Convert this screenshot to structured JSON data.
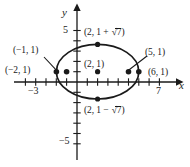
{
  "figure": {
    "background_color": "#ffffff",
    "ink_color": "#1a1a1a"
  },
  "axes": {
    "x_axis_name": "x",
    "y_axis_name": "y",
    "x_tick_labels": [
      {
        "text": "−3",
        "value": -3
      },
      {
        "text": "7",
        "value": 7
      }
    ],
    "y_tick_labels": [
      {
        "text": "5",
        "value": 5
      },
      {
        "text": "−5",
        "value": -5
      }
    ]
  },
  "points": [
    {
      "name": "vertex-top",
      "label_prefix": "(2, 1 + ",
      "label_radical": "7",
      "label_suffix": ")",
      "x": 2,
      "y": 3.6458
    },
    {
      "name": "vertex-bottom",
      "label_prefix": "(2, 1 − ",
      "label_radical": "7",
      "label_suffix": ")",
      "x": 2,
      "y": -1.6458
    },
    {
      "name": "vertex-left",
      "label": "(−2, 1)",
      "x": -2,
      "y": 1
    },
    {
      "name": "focus-left",
      "label": "(−1, 1)",
      "x": -1,
      "y": 1
    },
    {
      "name": "center",
      "label": "(2, 1)",
      "x": 2,
      "y": 1
    },
    {
      "name": "focus-right",
      "label": "(5, 1)",
      "x": 5,
      "y": 1
    },
    {
      "name": "vertex-right",
      "label": "(6, 1)",
      "x": 6,
      "y": 1
    }
  ],
  "curve": {
    "type": "ellipse",
    "center_x": 2,
    "center_y": 1,
    "semi_major_a": 4,
    "semi_minor_b": 2.6458
  },
  "labels": {
    "top_vertex_pre": "(2, 1 + ",
    "top_vertex_rad": "7",
    "top_vertex_post": ")",
    "bottom_vertex_pre": "(2, 1 − ",
    "bottom_vertex_rad": "7",
    "bottom_vertex_post": ")",
    "left_vertex": "(−2, 1)",
    "left_focus": "(−1, 1)",
    "center": "(2, 1)",
    "right_focus": "(5, 1)",
    "right_vertex": "(6, 1)",
    "x_name": "x",
    "y_name": "y",
    "tick_neg3": "−3",
    "tick_7": "7",
    "tick_5": "5",
    "tick_neg5": "−5"
  }
}
